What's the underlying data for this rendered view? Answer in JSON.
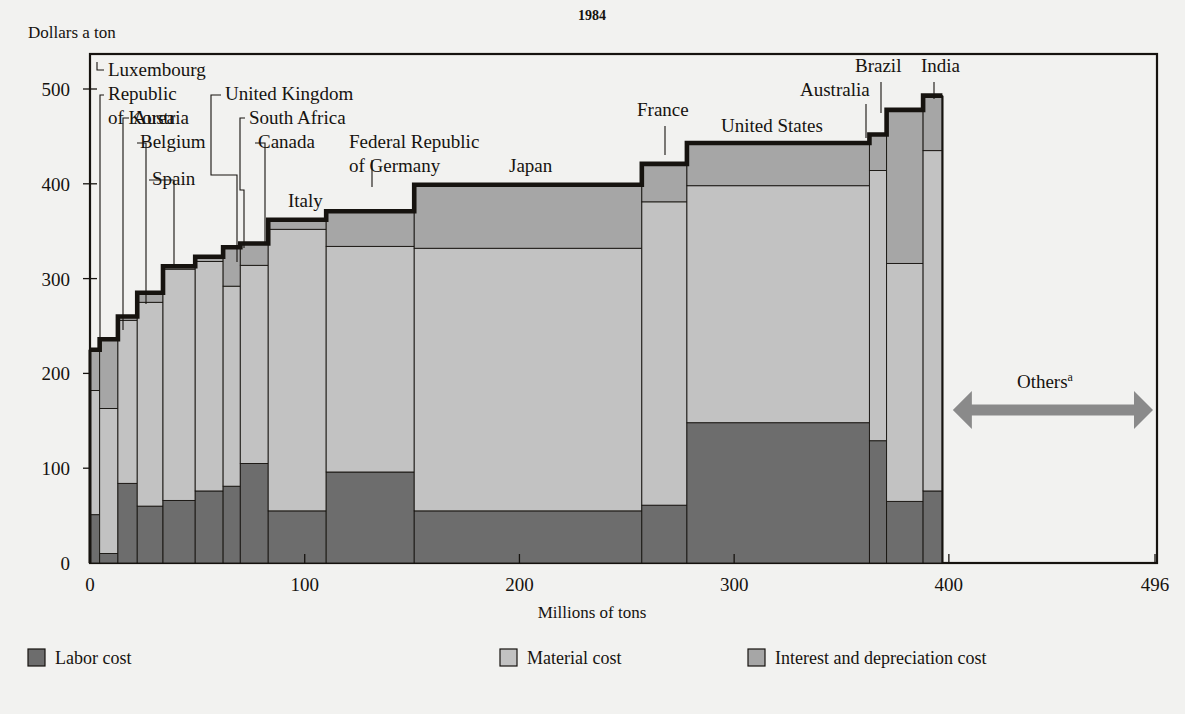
{
  "header": {
    "title": "1984"
  },
  "axes": {
    "y_title": "Dollars a ton",
    "x_title": "Millions of tons",
    "y_ticks": [
      "0",
      "100",
      "200",
      "300",
      "400",
      "500"
    ],
    "x_ticks": [
      "0",
      "100",
      "200",
      "300",
      "400",
      "496"
    ]
  },
  "annotation": {
    "others_label": "Others",
    "others_superscript": "a"
  },
  "legend": {
    "items": [
      {
        "label": "Labor cost",
        "color": "#6d6d6d"
      },
      {
        "label": "Material cost",
        "color": "#c2c2c2"
      },
      {
        "label": "Interest and depreciation cost",
        "color": "#a6a6a6"
      }
    ]
  },
  "colors": {
    "background": "#f2f2f0",
    "labor": "#6d6d6d",
    "material": "#c2c2c2",
    "interest": "#a6a6a6",
    "outline": "#16130f",
    "arrow": "#8a8a8a"
  },
  "chart_data": {
    "type": "bar",
    "title": "1984",
    "xlabel": "Millions of tons",
    "ylabel": "Dollars a ton",
    "xlim": [
      0,
      496
    ],
    "ylim": [
      0,
      520
    ],
    "grid": false,
    "note": "Variable-width stacked bars (marimekko). Width = production in millions of tons, height = cost in dollars a ton.",
    "series_names": [
      "Labor cost",
      "Material cost",
      "Interest and depreciation cost"
    ],
    "x_tick_values": [
      0,
      100,
      200,
      300,
      400,
      496
    ],
    "y_tick_values": [
      0,
      100,
      200,
      300,
      400,
      500
    ],
    "bars": [
      {
        "name": "Luxembourg",
        "x0": 0,
        "x1": 4.5,
        "labor": 51,
        "material": 182,
        "total": 225,
        "label_anchor": "start"
      },
      {
        "name": "Republic of Korea",
        "x0": 4.5,
        "x1": 13,
        "labor": 10,
        "material": 163,
        "total": 236,
        "label_anchor": "start"
      },
      {
        "name": "Austria",
        "x0": 13,
        "x1": 22,
        "labor": 84,
        "material": 256,
        "total": 260,
        "label_anchor": "start"
      },
      {
        "name": "Belgium",
        "x0": 22,
        "x1": 34,
        "labor": 60,
        "material": 275,
        "total": 285,
        "label_anchor": "start"
      },
      {
        "name": "Spain",
        "x0": 34,
        "x1": 49,
        "labor": 66,
        "material": 310,
        "total": 313,
        "label_anchor": "start"
      },
      {
        "name": "United Kingdom",
        "x0": 49,
        "x1": 62,
        "labor": 76,
        "material": 318,
        "total": 323,
        "label_anchor": "start"
      },
      {
        "name": "South Africa",
        "x0": 62,
        "x1": 70,
        "labor": 81,
        "material": 292,
        "total": 333,
        "label_anchor": "start"
      },
      {
        "name": "Canada",
        "x0": 70,
        "x1": 83,
        "labor": 105,
        "material": 314,
        "total": 337,
        "label_anchor": "start"
      },
      {
        "name": "Italy",
        "x0": 83,
        "x1": 110,
        "labor": 55,
        "material": 352,
        "total": 362,
        "label_anchor": "middle"
      },
      {
        "name": "Federal Republic of Germany",
        "x0": 110,
        "x1": 151,
        "labor": 96,
        "material": 334,
        "total": 371,
        "label_anchor": "middle"
      },
      {
        "name": "Japan",
        "x0": 151,
        "x1": 257,
        "labor": 55,
        "material": 332,
        "total": 399,
        "label_anchor": "middle"
      },
      {
        "name": "France",
        "x0": 257,
        "x1": 278,
        "labor": 61,
        "material": 381,
        "total": 421,
        "label_anchor": "middle"
      },
      {
        "name": "United States",
        "x0": 278,
        "x1": 363,
        "labor": 148,
        "material": 398,
        "total": 443,
        "label_anchor": "middle"
      },
      {
        "name": "Australia",
        "x0": 363,
        "x1": 371,
        "labor": 129,
        "material": 414,
        "total": 452,
        "label_anchor": "middle"
      },
      {
        "name": "Brazil",
        "x0": 371,
        "x1": 388,
        "labor": 65,
        "material": 316,
        "total": 478,
        "label_anchor": "middle"
      },
      {
        "name": "India",
        "x0": 388,
        "x1": 397,
        "labor": 76,
        "material": 435,
        "total": 493,
        "label_anchor": "middle"
      }
    ],
    "others": {
      "from": 400,
      "to": 496,
      "label": "Others",
      "superscript": "a",
      "value_at_y": 250
    }
  },
  "callouts": [
    {
      "name": "Luxembourg",
      "text_lines": [
        "Luxembourg"
      ],
      "tx": 108,
      "ty": 76,
      "anchor": "start",
      "leader": [
        [
          104,
          70
        ],
        [
          97,
          70
        ],
        [
          97,
          62
        ]
      ]
    },
    {
      "name": "Republic of Korea",
      "text_lines": [
        "Republic",
        "of Korea"
      ],
      "tx": 108,
      "ty": 100,
      "anchor": "start",
      "leader": [
        [
          104,
          95
        ],
        [
          100,
          95
        ],
        [
          100,
          345
        ]
      ]
    },
    {
      "name": "Austria",
      "text_lines": [
        "Austria"
      ],
      "tx": 133,
      "ty": 124,
      "anchor": "start",
      "leader": [
        [
          129,
          118
        ],
        [
          123,
          118
        ],
        [
          123,
          330
        ]
      ]
    },
    {
      "name": "Belgium",
      "text_lines": [
        "Belgium"
      ],
      "tx": 140,
      "ty": 148,
      "anchor": "start",
      "leader": [
        [
          137,
          143
        ],
        [
          146,
          143
        ],
        [
          146,
          304
        ]
      ]
    },
    {
      "name": "Spain",
      "text_lines": [
        "Spain"
      ],
      "tx": 152,
      "ty": 185,
      "anchor": "start",
      "leader": [
        [
          149,
          180
        ],
        [
          174,
          180
        ],
        [
          174,
          267
        ]
      ]
    },
    {
      "name": "United Kingdom",
      "text_lines": [
        "United Kingdom"
      ],
      "tx": 225,
      "ty": 100,
      "anchor": "start",
      "leader": [
        [
          221,
          95
        ],
        [
          211,
          95
        ],
        [
          211,
          175
        ],
        [
          237,
          175
        ],
        [
          237,
          262
        ]
      ]
    },
    {
      "name": "South Africa",
      "text_lines": [
        "South Africa"
      ],
      "tx": 249,
      "ty": 124,
      "anchor": "start",
      "leader": [
        [
          245,
          118
        ],
        [
          240,
          118
        ],
        [
          240,
          190
        ],
        [
          244,
          190
        ],
        [
          244,
          248
        ]
      ]
    },
    {
      "name": "Canada",
      "text_lines": [
        "Canada"
      ],
      "tx": 258,
      "ty": 148,
      "anchor": "start",
      "leader": [
        [
          255,
          143
        ],
        [
          265,
          143
        ],
        [
          265,
          242
        ]
      ]
    },
    {
      "name": "Italy",
      "text_lines": [
        "Italy"
      ],
      "tx": 288,
      "ty": 207,
      "anchor": "start",
      "leader": null
    },
    {
      "name": "Federal Republic of Germany",
      "text_lines": [
        "Federal Republic",
        "of Germany"
      ],
      "tx": 349,
      "ty": 148,
      "anchor": "start",
      "leader": [
        [
          372,
          160
        ],
        [
          372,
          187
        ]
      ]
    },
    {
      "name": "Japan",
      "text_lines": [
        "Japan"
      ],
      "tx": 509,
      "ty": 172,
      "anchor": "start",
      "leader": null
    },
    {
      "name": "France",
      "text_lines": [
        "France"
      ],
      "tx": 637,
      "ty": 116,
      "anchor": "start",
      "leader": [
        [
          665,
          126
        ],
        [
          665,
          155
        ]
      ]
    },
    {
      "name": "United States",
      "text_lines": [
        "United States"
      ],
      "tx": 721,
      "ty": 132,
      "anchor": "start",
      "leader": null
    },
    {
      "name": "Australia",
      "text_lines": [
        "Australia"
      ],
      "tx": 800,
      "ty": 96,
      "anchor": "start",
      "leader": [
        [
          866,
          104
        ],
        [
          866,
          138
        ]
      ]
    },
    {
      "name": "Brazil",
      "text_lines": [
        "Brazil"
      ],
      "tx": 855,
      "ty": 72,
      "anchor": "start",
      "leader": [
        [
          881,
          82
        ],
        [
          881,
          113
        ]
      ]
    },
    {
      "name": "India",
      "text_lines": [
        "India"
      ],
      "tx": 921,
      "ty": 72,
      "anchor": "start",
      "leader": [
        [
          934,
          82
        ],
        [
          934,
          99
        ]
      ]
    }
  ]
}
